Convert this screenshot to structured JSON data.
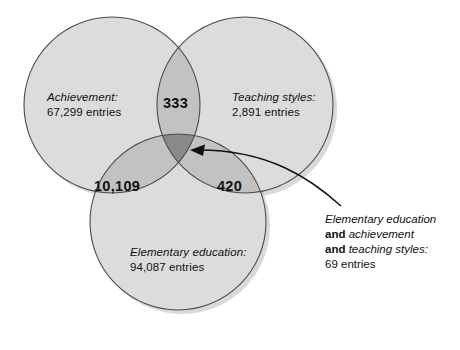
{
  "diagram": {
    "type": "venn-3-set",
    "background_color": "#ffffff",
    "fills": {
      "single": "#dcdcdc",
      "pair": "#c2c2c2",
      "triple": "#8a8a8a",
      "stroke": "#4a4a4a",
      "shadow": "#b9b9b9"
    },
    "sets": [
      {
        "id": "achievement",
        "name_line": "Achievement:",
        "count_line": "67,299 entries",
        "count": 67299,
        "position": "top-left"
      },
      {
        "id": "teaching-styles",
        "name_line": "Teaching styles:",
        "count_line": "2,891 entries",
        "count": 2891,
        "position": "top-right"
      },
      {
        "id": "elementary-education",
        "name_line": "Elementary education:",
        "count_line": "94,087 entries",
        "count": 94087,
        "position": "bottom"
      }
    ],
    "intersections": [
      {
        "id": "achievement-teaching",
        "label": "333",
        "value": 333,
        "sets": [
          "achievement",
          "teaching-styles"
        ]
      },
      {
        "id": "achievement-elementary",
        "label": "10,109",
        "value": 10109,
        "sets": [
          "achievement",
          "elementary-education"
        ]
      },
      {
        "id": "teaching-elementary",
        "label": "420",
        "value": 420,
        "sets": [
          "teaching-styles",
          "elementary-education"
        ]
      }
    ],
    "callout": {
      "line1_italic": "Elementary education",
      "line2_bold": "and",
      "line2_italic": " achievement",
      "line3_bold": "and",
      "line3_italic": " teaching styles:",
      "line4": "69 entries",
      "value": 69,
      "points_to": "triple-intersection"
    }
  }
}
